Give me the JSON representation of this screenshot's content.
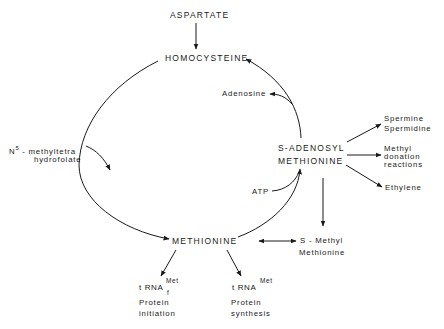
{
  "diagram": {
    "nodes": {
      "aspartate": "ASPARTATE",
      "homocysteine": "HOMOCYSTEINE",
      "adenosine": "Adenosine",
      "n5_line1_prefix": "N",
      "n5_line1_sup": "5",
      "n5_line1_rest": " - methyltetra",
      "n5_line2": "hydrofolate",
      "sam_line1": "S-ADENOSYL",
      "sam_line2": "METHIONINE",
      "atp": "ATP",
      "methionine": "METHIONINE",
      "smm_line1": "S - Methyl",
      "smm_line2": "Methionine",
      "spermine": "Spermine",
      "spermidine": "Spermidine",
      "methyl_donation_1": "Methyl",
      "methyl_donation_2": "donation",
      "methyl_donation_3": "reactions",
      "ethylene": "Ethylene",
      "trna_f_base": "t RNA",
      "trna_f_sup": "Met",
      "trna_f_sub": "f",
      "trna_f_caption_1": "Protein",
      "trna_f_caption_2": "initiation",
      "trna_base": "t RNA",
      "trna_sup": "Met",
      "trna_caption_1": "Protein",
      "trna_caption_2": "synthesis"
    },
    "edges": [
      {
        "from": "ASPARTATE",
        "to": "HOMOCYSTEINE"
      },
      {
        "from": "HOMOCYSTEINE",
        "to": "METHIONINE",
        "via": "N5-methyltetrahydrofolate"
      },
      {
        "from": "METHIONINE",
        "to": "S-ADENOSYL METHIONINE",
        "via": "ATP"
      },
      {
        "from": "S-ADENOSYL METHIONINE",
        "to": "HOMOCYSTEINE",
        "releases": "Adenosine"
      },
      {
        "from": "S-ADENOSYL METHIONINE",
        "to": "Spermine Spermidine"
      },
      {
        "from": "S-ADENOSYL METHIONINE",
        "to": "Methyl donation reactions"
      },
      {
        "from": "S-ADENOSYL METHIONINE",
        "to": "Ethylene"
      },
      {
        "from": "S-ADENOSYL METHIONINE",
        "to": "S-Methyl Methionine"
      },
      {
        "from": "METHIONINE",
        "to": "S-Methyl Methionine",
        "bidirectional": true
      },
      {
        "from": "METHIONINE",
        "to": "tRNA f Met"
      },
      {
        "from": "METHIONINE",
        "to": "tRNA Met"
      }
    ],
    "colors": {
      "ink": "#1a1a1a",
      "background": "#ffffff"
    }
  }
}
